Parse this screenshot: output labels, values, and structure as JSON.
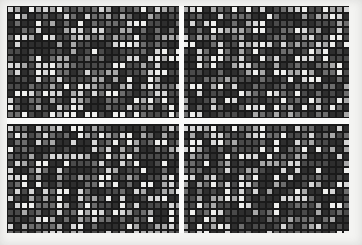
{
  "image": {
    "kind": "mosaic-grid",
    "title": "Grayscale mosaic grid",
    "width": 362,
    "height": 245,
    "background_color": "#f4f4f2",
    "alt_text": "Dense grayscale checkerboard mosaic of small squares with a white horizontal band and a white vertical stripe"
  },
  "grid": {
    "origin_x": 7,
    "origin_y": 6,
    "end_x": 349,
    "end_y": 233,
    "cell_pitch_x": 7,
    "cell_pitch_y": 7,
    "cell_size": 5,
    "line_width": 2,
    "columns": 49,
    "rows": 33,
    "line_color": "#1a1a1a",
    "tone_colors": [
      "#2e2e2e",
      "#4a4a4a",
      "#6d6d6d",
      "#a8a8a8",
      "#d6d6d6",
      "#efefed"
    ],
    "tone_weights": [
      26,
      22,
      16,
      12,
      12,
      12
    ],
    "seed": 20240517
  },
  "gutters": {
    "horizontal": {
      "label": "horizontal white band",
      "x": 7,
      "y": 118,
      "width": 342,
      "height": 6,
      "color": "#fbfbfa"
    },
    "vertical": {
      "label": "vertical white stripe",
      "x": 179,
      "y": 6,
      "width": 5,
      "height": 227,
      "color": "#fbfbfa"
    }
  },
  "margins": {
    "left": 7,
    "top": 6,
    "right": 13,
    "bottom": 12,
    "color": "#f4f4f2"
  }
}
